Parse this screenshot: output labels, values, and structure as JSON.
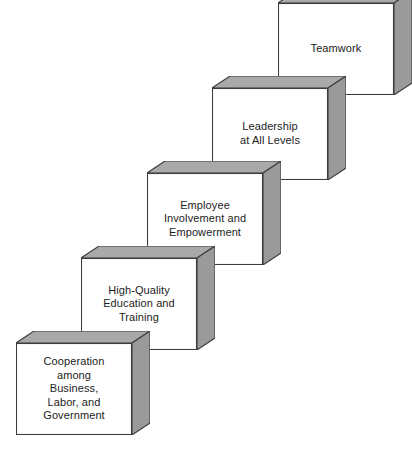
{
  "diagram": {
    "type": "3d-staircase-blocks",
    "background_color": "#ffffff",
    "block_face_color": "#ffffff",
    "block_top_color": "#a9a9a9",
    "block_side_color": "#9a9a9a",
    "block_outline_color": "#3d3d3d",
    "text_color": "#1c1c1c",
    "blocks": [
      {
        "id": "block-cooperation",
        "step": 1,
        "label": "Cooperation\namong\nBusiness,\nLabor, and\nGovernment",
        "x": 16,
        "y": 331
      },
      {
        "id": "block-education",
        "step": 2,
        "label": "High-Quality\nEducation and\nTraining",
        "x": 81,
        "y": 246
      },
      {
        "id": "block-involvement",
        "step": 3,
        "label": "Employee\nInvolvement and\nEmpowerment",
        "x": 147,
        "y": 161
      },
      {
        "id": "block-leadership",
        "step": 4,
        "label": "Leadership\nat All Levels",
        "x": 212,
        "y": 76
      },
      {
        "id": "block-teamwork",
        "step": 5,
        "label": "Teamwork",
        "x": 278,
        "y": -9
      }
    ]
  }
}
